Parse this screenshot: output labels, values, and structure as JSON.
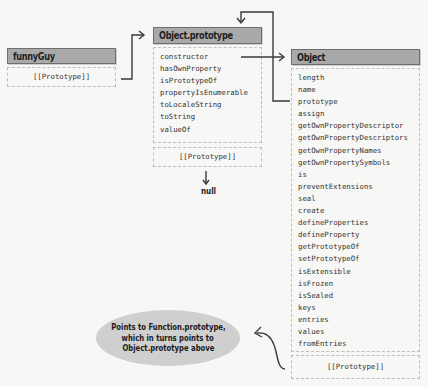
{
  "funny_guy": {
    "title": "funnyGuy",
    "proto_label": "[[Prototype]]"
  },
  "object_prototype": {
    "title": "Object.prototype",
    "members": [
      "constructor",
      "hasOwnProperty",
      "isPrototypeOf",
      "propertyIsEnumerable",
      "toLocaleString",
      "toString",
      "valueOf"
    ],
    "proto_label": "[[Prototype]]",
    "null_label": "null"
  },
  "object": {
    "title": "Object",
    "members": [
      "length",
      "name",
      "prototype",
      "assign",
      "getOwnPropertyDescriptor",
      "getOwnPropertyDescriptors",
      "getOwnPropertyNames",
      "getOwnPropertySymbols",
      "is",
      "preventExtensions",
      "seal",
      "create",
      "defineProperties",
      "defineProperty",
      "getPrototypeOf",
      "setPrototypeOf",
      "isExtensible",
      "isFrozen",
      "isSealed",
      "keys",
      "entries",
      "values",
      "fromEntries"
    ],
    "proto_label": "[[Prototype]]"
  },
  "callout": {
    "lines": [
      "Points to Function.prototype,",
      "which in turns points to",
      "Object.prototype above"
    ]
  },
  "colors": {
    "header_fill": "#a9a9a9",
    "bubble_fill": "#cfcfcf",
    "line": "#3a3a3a",
    "background": "#f7f7f5"
  }
}
